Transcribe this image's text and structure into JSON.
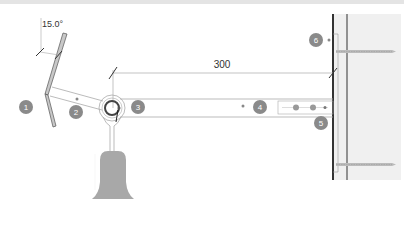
{
  "diagram": {
    "type": "technical-mounting-drawing",
    "angle_label": "15.0°",
    "dimension_label": "300",
    "callouts": [
      {
        "id": 1,
        "label": "1"
      },
      {
        "id": 2,
        "label": "2"
      },
      {
        "id": 3,
        "label": "3"
      },
      {
        "id": 4,
        "label": "4"
      },
      {
        "id": 5,
        "label": "5"
      },
      {
        "id": 6,
        "label": "6"
      }
    ],
    "colors": {
      "callout_fill": "#8a8a8a",
      "wall_fill": "#f0f0f0",
      "line": "#444444",
      "light_line": "#aaaaaa",
      "lamp_shade": "#a8a8a8"
    }
  }
}
